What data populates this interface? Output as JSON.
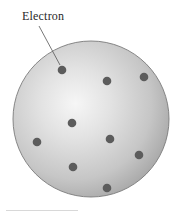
{
  "figure": {
    "label": "Electron",
    "colors": {
      "sphere_highlight": "#f4f4f4",
      "sphere_mid": "#d2d2d2",
      "sphere_edge": "#a9a9a9",
      "sphere_outline": "#7a7a7a",
      "electron": "#5c5c5c",
      "leader_line": "#555555",
      "label_text": "#2a2a2a"
    },
    "sphere": {
      "cx": 91,
      "cy": 119,
      "r": 78
    },
    "electrons": [
      {
        "cx": 62,
        "cy": 70
      },
      {
        "cx": 107,
        "cy": 81
      },
      {
        "cx": 144,
        "cy": 77
      },
      {
        "cx": 72,
        "cy": 123
      },
      {
        "cx": 37,
        "cy": 142
      },
      {
        "cx": 110,
        "cy": 139
      },
      {
        "cx": 139,
        "cy": 155
      },
      {
        "cx": 73,
        "cy": 167
      },
      {
        "cx": 107,
        "cy": 188
      }
    ],
    "leader": {
      "x1": 39,
      "y1": 26,
      "x2": 60,
      "y2": 65
    }
  }
}
